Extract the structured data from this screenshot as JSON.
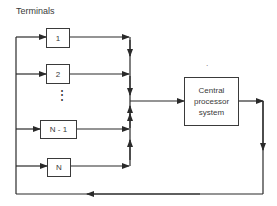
{
  "diagram": {
    "title": "Terminals",
    "terminals": [
      {
        "label": "1"
      },
      {
        "label": "2"
      },
      {
        "label": "N - 1"
      },
      {
        "label": "N"
      }
    ],
    "ellipsis": "⋮",
    "processor": {
      "line1": "Central",
      "line2": "processor",
      "line3": "system"
    },
    "mark": "·",
    "colors": {
      "line": "#2a2a2a",
      "box_border": "#3a3a3a"
    }
  }
}
